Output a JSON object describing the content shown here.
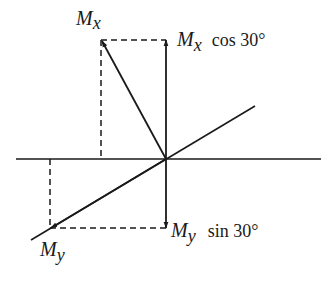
{
  "diagram": {
    "origin": [
      166,
      159
    ],
    "labels": {
      "mx": "M",
      "mx_sub": "x",
      "mx_cos_m": "M",
      "mx_cos_sub": "x",
      "mx_cos_text": "cos 30°",
      "my": "M",
      "my_sub": "y",
      "my_sin_m": "M",
      "my_sin_sub": "y",
      "my_sin_text": "sin 30°"
    },
    "colors": {
      "stroke": "#1a1a1a",
      "background": "#ffffff"
    }
  }
}
